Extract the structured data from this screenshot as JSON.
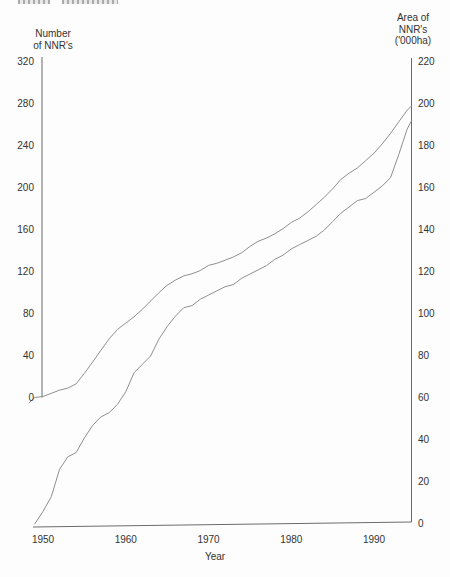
{
  "chart_data": {
    "type": "line",
    "title": "",
    "x_axis": {
      "label": "Year",
      "ticks": [
        1950,
        1960,
        1970,
        1980,
        1990
      ],
      "range": [
        1949,
        1995
      ]
    },
    "left_axis": {
      "title_lines": [
        "Number",
        "of NNR's"
      ],
      "ticks": [
        320,
        280,
        240,
        200,
        160,
        120,
        80,
        40,
        0
      ],
      "range": [
        0,
        320
      ]
    },
    "right_axis": {
      "title_lines": [
        "Area of",
        "NNR's",
        "('000ha)"
      ],
      "ticks": [
        220,
        200,
        180,
        160,
        140,
        120,
        100,
        80,
        60,
        40,
        20,
        0
      ],
      "range": [
        0,
        220
      ]
    },
    "grid": false,
    "legend": "none",
    "line_color": "#8f8f8f",
    "axis_color": "#6b6b6b",
    "text_color": "#333333",
    "series": [
      {
        "name": "Number of NNR's",
        "axis": "left",
        "years": [
          1949,
          1950,
          1951,
          1952,
          1953,
          1954,
          1955,
          1956,
          1957,
          1958,
          1959,
          1960,
          1961,
          1962,
          1963,
          1964,
          1965,
          1966,
          1967,
          1968,
          1969,
          1970,
          1971,
          1972,
          1973,
          1974,
          1975,
          1976,
          1977,
          1978,
          1979,
          1980,
          1981,
          1982,
          1983,
          1984,
          1985,
          1986,
          1987,
          1988,
          1989,
          1990,
          1991,
          1992,
          1993,
          1994,
          1995
        ],
        "values": [
          0,
          1,
          4,
          7,
          9,
          13,
          23,
          34,
          45,
          56,
          65,
          71,
          77,
          84,
          92,
          100,
          107,
          112,
          116,
          118,
          121,
          126,
          128,
          131,
          134,
          138,
          144,
          149,
          152,
          156,
          161,
          167,
          171,
          177,
          184,
          191,
          199,
          208,
          214,
          219,
          226,
          233,
          242,
          252,
          263,
          274,
          278
        ]
      },
      {
        "name": "Area of NNR's ('000ha)",
        "axis": "right",
        "years": [
          1949,
          1950,
          1951,
          1952,
          1953,
          1954,
          1955,
          1956,
          1957,
          1958,
          1959,
          1960,
          1961,
          1962,
          1963,
          1964,
          1965,
          1966,
          1967,
          1968,
          1969,
          1970,
          1971,
          1972,
          1973,
          1974,
          1975,
          1976,
          1977,
          1978,
          1979,
          1980,
          1981,
          1982,
          1983,
          1984,
          1985,
          1986,
          1987,
          1988,
          1989,
          1990,
          1991,
          1992,
          1993,
          1994,
          1995
        ],
        "values": [
          0,
          6,
          13,
          26,
          32,
          34,
          41,
          47,
          51,
          53,
          57,
          63,
          72,
          76,
          80,
          88,
          94,
          99,
          103,
          104,
          107,
          109,
          111,
          113,
          114,
          117,
          119,
          121,
          123,
          126,
          128,
          131,
          133,
          135,
          137,
          140,
          144,
          148,
          151,
          154,
          155,
          158,
          161,
          165,
          176,
          188,
          192
        ]
      }
    ]
  }
}
